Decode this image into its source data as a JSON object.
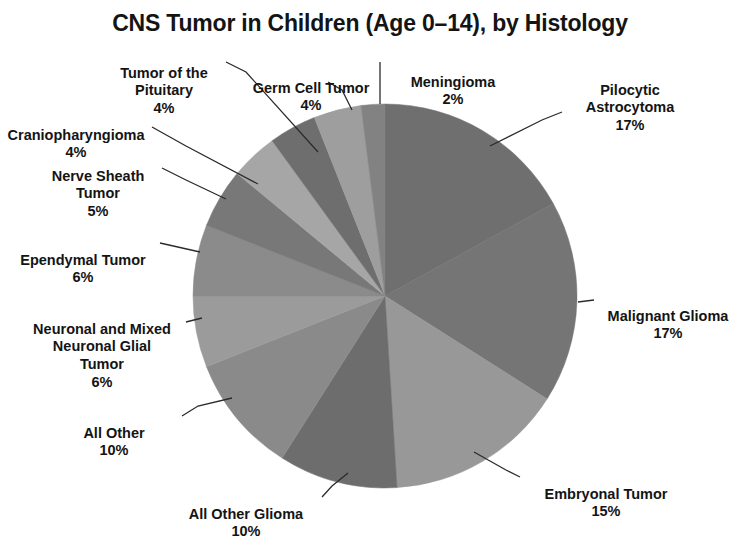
{
  "chart_data": {
    "type": "pie",
    "title": "CNS Tumor in Children (Age 0–14), by Histology",
    "xlabel": "",
    "ylabel": "",
    "legend": "none",
    "grid": false,
    "units": "percent",
    "start_angle_deg": 0,
    "direction": "clockwise",
    "categories": [
      "Pilocytic Astrocytoma",
      "Malignant Glioma",
      "Embryonal Tumor",
      "All Other Glioma",
      "All Other",
      "Neuronal and Mixed Neuronal Glial Tumor",
      "Ependymal Tumor",
      "Nerve Sheath Tumor",
      "Craniopharyngioma",
      "Tumor of the Pituitary",
      "Germ Cell Tumor",
      "Meningioma"
    ],
    "values": [
      17,
      17,
      15,
      10,
      10,
      6,
      6,
      5,
      4,
      4,
      4,
      2
    ],
    "slices": [
      {
        "name": "Pilocytic Astrocytoma",
        "label": "Pilocytic\nAstrocytoma",
        "percent_label": "17%",
        "value": 17,
        "color": "#6f6f6f",
        "start_deg": 0,
        "end_deg": 61.2
      },
      {
        "name": "Malignant Glioma",
        "label": "Malignant Glioma",
        "percent_label": "17%",
        "value": 17,
        "color": "#757575",
        "start_deg": 61.2,
        "end_deg": 122.4
      },
      {
        "name": "Embryonal Tumor",
        "label": "Embryonal Tumor",
        "percent_label": "15%",
        "value": 15,
        "color": "#989898",
        "start_deg": 122.4,
        "end_deg": 176.4
      },
      {
        "name": "All Other Glioma",
        "label": "All Other Glioma",
        "percent_label": "10%",
        "value": 10,
        "color": "#6d6d6d",
        "start_deg": 176.4,
        "end_deg": 212.4
      },
      {
        "name": "All Other",
        "label": "All Other",
        "percent_label": "10%",
        "value": 10,
        "color": "#8a8a8a",
        "start_deg": 212.4,
        "end_deg": 248.4
      },
      {
        "name": "Neuronal and Mixed Neuronal Glial Tumor",
        "label": "Neuronal and Mixed\nNeuronal Glial\nTumor",
        "percent_label": "6%",
        "value": 6,
        "color": "#9b9b9b",
        "start_deg": 248.4,
        "end_deg": 270.0
      },
      {
        "name": "Ependymal Tumor",
        "label": "Ependymal Tumor",
        "percent_label": "6%",
        "value": 6,
        "color": "#8b8b8b",
        "start_deg": 270.0,
        "end_deg": 291.6
      },
      {
        "name": "Nerve Sheath Tumor",
        "label": "Nerve Sheath\nTumor",
        "percent_label": "5%",
        "value": 5,
        "color": "#787878",
        "start_deg": 291.6,
        "end_deg": 309.6
      },
      {
        "name": "Craniopharyngioma",
        "label": "Craniopharyngioma",
        "percent_label": "4%",
        "value": 4,
        "color": "#a6a6a6",
        "start_deg": 309.6,
        "end_deg": 324.0
      },
      {
        "name": "Tumor of the Pituitary",
        "label": "Tumor of the\nPituitary",
        "percent_label": "4%",
        "value": 4,
        "color": "#6e6e6e",
        "start_deg": 324.0,
        "end_deg": 338.4
      },
      {
        "name": "Germ Cell Tumor",
        "label": "Germ Cell Tumor",
        "percent_label": "4%",
        "value": 4,
        "color": "#9e9e9e",
        "start_deg": 338.4,
        "end_deg": 352.8
      },
      {
        "name": "Meningioma",
        "label": "Meningioma",
        "percent_label": "2%",
        "value": 2,
        "color": "#828282",
        "start_deg": 352.8,
        "end_deg": 360.0
      }
    ]
  },
  "labels": {
    "pilocytic_astrocytoma": {
      "text": "Pilocytic\nAstrocytoma",
      "pct": "17%"
    },
    "malignant_glioma": {
      "text": "Malignant Glioma",
      "pct": "17%"
    },
    "embryonal_tumor": {
      "text": "Embryonal Tumor",
      "pct": "15%"
    },
    "all_other_glioma": {
      "text": "All Other Glioma",
      "pct": "10%"
    },
    "all_other": {
      "text": "All Other",
      "pct": "10%"
    },
    "neuronal_mixed": {
      "text": "Neuronal and Mixed\nNeuronal Glial\nTumor",
      "pct": "6%"
    },
    "ependymal_tumor": {
      "text": "Ependymal Tumor",
      "pct": "6%"
    },
    "nerve_sheath_tumor": {
      "text": "Nerve Sheath\nTumor",
      "pct": "5%"
    },
    "craniopharyngioma": {
      "text": "Craniopharyngioma",
      "pct": "4%"
    },
    "tumor_of_the_pituitary": {
      "text": "Tumor of the\nPituitary",
      "pct": "4%"
    },
    "germ_cell_tumor": {
      "text": "Germ Cell Tumor",
      "pct": "4%"
    },
    "meningioma": {
      "text": "Meningioma",
      "pct": "2%"
    }
  },
  "style": {
    "background": "#ffffff",
    "text_color": "#141414",
    "leader_line_color": "#2b2b2b"
  }
}
